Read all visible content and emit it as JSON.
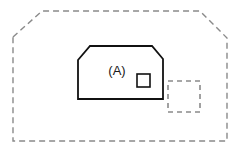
{
  "canvas": {
    "width": 244,
    "height": 153,
    "background_color": "#ffffff"
  },
  "diagram": {
    "title_label": "(A)",
    "shapes": {
      "site_boundary": {
        "name": "site-boundary",
        "style": "dashed",
        "stroke_color": "#8a8a8a",
        "stroke_width": 1.4,
        "dash_pattern": "6,4",
        "fill": "none",
        "points": "13,37 42,11 200,11 227,38 227,141 13,141"
      },
      "main_building": {
        "name": "main-building",
        "style": "solid",
        "stroke_color": "#111111",
        "stroke_width": 1.8,
        "fill": "none",
        "points": "78,60 90,46 152,46 163,59 163,99 78,99"
      },
      "small_unit": {
        "name": "small-unit",
        "style": "solid",
        "stroke_color": "#111111",
        "stroke_width": 1.6,
        "fill": "none",
        "x": 137,
        "y": 74,
        "width": 13,
        "height": 13
      },
      "proposed_extension": {
        "name": "proposed-extension",
        "style": "dashed",
        "stroke_color": "#8a8a8a",
        "stroke_width": 1.6,
        "dash_pattern": "5,4",
        "fill": "none",
        "x": 168,
        "y": 81,
        "width": 32,
        "height": 31
      }
    },
    "labels": [
      {
        "name": "building-label-a",
        "text": "(A)",
        "x": 117,
        "y": 72,
        "font_size": 13,
        "color": "#1a1a1a"
      }
    ]
  }
}
